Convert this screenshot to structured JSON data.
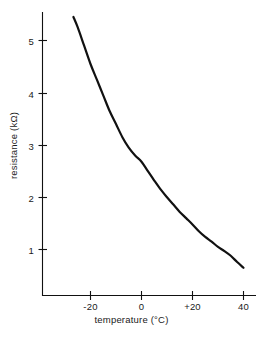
{
  "chart_data": {
    "type": "line",
    "title": "",
    "xlabel": "temperature (°C)",
    "ylabel": "resistance (kΩ)",
    "xlim": [
      -35,
      44
    ],
    "ylim": [
      0,
      5.75
    ],
    "xticks": [
      -20,
      0,
      20,
      40
    ],
    "xticklabels": [
      "-20",
      "0",
      "+20",
      "40"
    ],
    "yticks": [
      1,
      2,
      3,
      4,
      5
    ],
    "yticklabels": [
      "1",
      "2",
      "3",
      "4",
      "5"
    ],
    "grid": false,
    "legend": null,
    "series": [
      {
        "name": "thermistor resistance",
        "color": "#111111",
        "linewidth": 2.2,
        "x": [
          -26.7,
          -25,
          -22.5,
          -20,
          -17.5,
          -15,
          -12.5,
          -10,
          -7.5,
          -5,
          -2.5,
          0,
          2.5,
          5,
          7.5,
          10,
          12.5,
          15,
          17.5,
          20,
          22.5,
          25,
          27.5,
          30,
          32.5,
          35,
          37.5,
          40
        ],
        "y": [
          5.45,
          5.25,
          4.9,
          4.55,
          4.25,
          3.95,
          3.65,
          3.4,
          3.15,
          2.95,
          2.8,
          2.68,
          2.5,
          2.32,
          2.15,
          2.0,
          1.86,
          1.72,
          1.6,
          1.48,
          1.35,
          1.24,
          1.15,
          1.05,
          0.97,
          0.88,
          0.76,
          0.65
        ]
      }
    ],
    "axis_origin": {
      "x_px": 42,
      "y_px": 296
    }
  },
  "axes": {
    "x_axis_name": "temperature-axis",
    "y_axis_name": "resistance-axis"
  }
}
